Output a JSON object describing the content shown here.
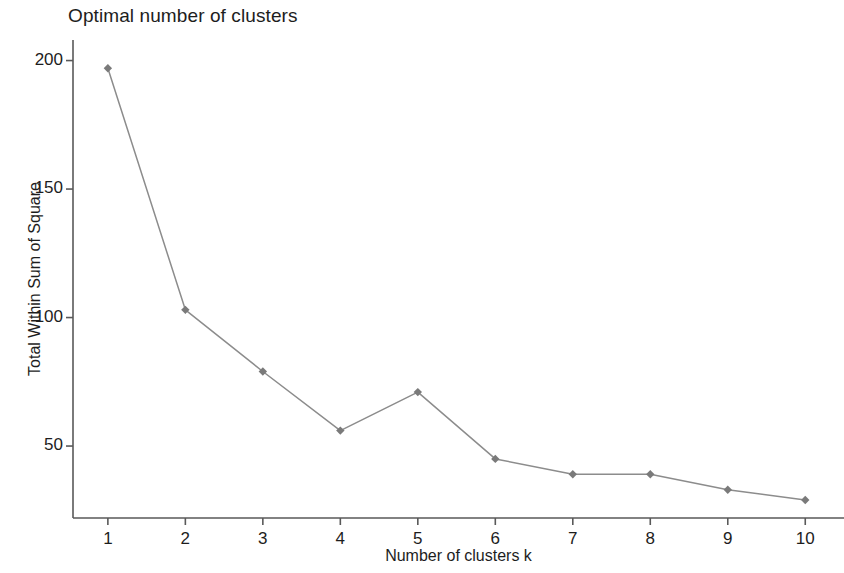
{
  "chart_data": {
    "type": "line",
    "title": "Optimal number of clusters",
    "xlabel": "Number of clusters k",
    "ylabel": "Total Within Sum of Square",
    "x": [
      1,
      2,
      3,
      4,
      5,
      6,
      7,
      8,
      9,
      10
    ],
    "values": [
      197,
      103,
      79,
      56,
      71,
      45,
      39,
      39,
      33,
      29
    ],
    "categories": [
      "1",
      "2",
      "3",
      "4",
      "5",
      "6",
      "7",
      "8",
      "9",
      "10"
    ],
    "series": [
      {
        "name": "Total Within Sum of Square",
        "values": [
          197,
          103,
          79,
          56,
          71,
          45,
          39,
          39,
          33,
          29
        ]
      }
    ],
    "xtick_labels": [
      "1",
      "2",
      "3",
      "4",
      "5",
      "6",
      "7",
      "8",
      "9",
      "10"
    ],
    "ytick_labels": [
      "50",
      "100",
      "150",
      "200"
    ],
    "ytick_values": [
      50,
      100,
      150,
      200
    ],
    "xlim": [
      0.55,
      10.5
    ],
    "ylim": [
      22,
      208
    ],
    "grid": false,
    "legend": "none",
    "line_color": "#8c8c8c",
    "marker_color": "#7a7a7a",
    "marker_shape": "diamond",
    "axis_color": "#595959",
    "background_color": "#ffffff",
    "text_color": "#1d1d1d"
  }
}
